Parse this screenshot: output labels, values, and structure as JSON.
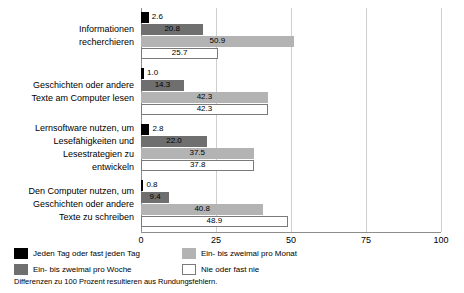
{
  "chart_data": {
    "type": "bar",
    "orientation": "horizontal",
    "title": "",
    "xlabel": "",
    "ylabel": "",
    "xlim": [
      0,
      100
    ],
    "xticks": [
      0,
      25,
      50,
      75,
      100
    ],
    "grid": true,
    "legend_position": "bottom-left",
    "categories": [
      "Informationen\nrecherchieren",
      "Geschichten oder andere\nTexte am Computer lesen",
      "Lernsoftware nutzen, um\nLesefähigkeiten und\nLesestrategien zu\nentwickeln",
      "Den Computer nutzen, um\nGeschichten oder andere\nTexte zu schreiben"
    ],
    "series": [
      {
        "name": "Jeden Tag oder fast jeden Tag",
        "color": "#000000",
        "values": [
          2.6,
          1.0,
          2.8,
          0.8
        ],
        "labels": [
          "2.6",
          "1.0",
          "2.8",
          "0.8"
        ]
      },
      {
        "name": "Ein- bis zweimal pro Woche",
        "color": "#6f6f6f",
        "values": [
          20.8,
          14.3,
          22.0,
          9.4
        ],
        "labels": [
          "20.8",
          "14.3",
          "22.0",
          "9.4"
        ]
      },
      {
        "name": "Ein- bis zweimal pro Monat",
        "color": "#b3b3b3",
        "values": [
          50.9,
          42.3,
          37.5,
          40.8
        ],
        "labels": [
          "50.9",
          "42.3",
          "37.5",
          "40.8"
        ]
      },
      {
        "name": "Nie oder fast nie",
        "color": "#ffffff",
        "values": [
          25.7,
          42.3,
          37.8,
          48.9
        ],
        "labels": [
          "25.7",
          "42.3",
          "37.8",
          "48.9"
        ]
      }
    ],
    "footnote": "Differenzen zu 100 Prozent resultieren aus Rundungsfehlern."
  },
  "axis": {
    "tick_labels": [
      "0",
      "25",
      "50",
      "75",
      "100"
    ]
  },
  "legend": {
    "items": [
      {
        "label": "Jeden Tag oder fast jeden Tag",
        "swatch": "black-swatch"
      },
      {
        "label": "Ein- bis zweimal pro Monat",
        "swatch": "light-gray-swatch"
      },
      {
        "label": "Ein- bis zweimal pro Woche",
        "swatch": "dark-gray-swatch"
      },
      {
        "label": "Nie oder fast nie",
        "swatch": "white-swatch"
      }
    ]
  },
  "footnote": {
    "text": "Differenzen zu 100 Prozent resultieren aus Rundungsfehlern."
  }
}
